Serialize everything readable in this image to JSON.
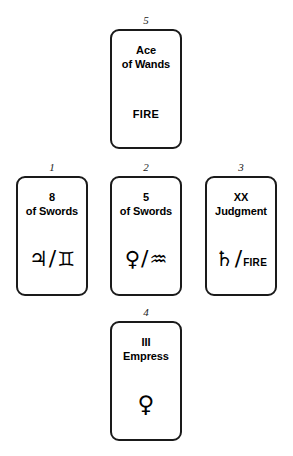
{
  "spread": {
    "name": "Cross Spread",
    "background_color": "#ffffff",
    "card_border_color": "#1a1a1a",
    "text_color": "#000000",
    "positions": [
      {
        "index": "1",
        "slot": "left",
        "rank": "8",
        "suit": "of Swords",
        "attribution_type": "planet-sign",
        "planet_name": "jupiter",
        "planet_glyph": "♃",
        "separator": "/",
        "sign_name": "gemini",
        "sign_glyph": "♊"
      },
      {
        "index": "2",
        "slot": "center",
        "rank": "5",
        "suit": "of Swords",
        "attribution_type": "planet-sign",
        "planet_name": "venus",
        "planet_glyph": "♀",
        "separator": "/",
        "sign_name": "aquarius",
        "sign_glyph": "♒"
      },
      {
        "index": "3",
        "slot": "right",
        "rank": "XX",
        "suit": "Judgment",
        "attribution_type": "planet-element",
        "planet_name": "saturn",
        "planet_glyph": "♄",
        "separator": "/",
        "element": "FIRE"
      },
      {
        "index": "4",
        "slot": "bottom",
        "rank": "III",
        "suit": "Empress",
        "attribution_type": "planet-only",
        "planet_name": "venus",
        "planet_glyph": "♀"
      },
      {
        "index": "5",
        "slot": "top",
        "rank": "Ace",
        "suit": "of Wands",
        "attribution_type": "element-only",
        "element": "FIRE"
      }
    ]
  }
}
